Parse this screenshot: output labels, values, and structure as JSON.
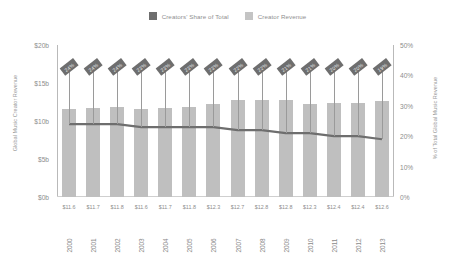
{
  "legend": {
    "items": [
      {
        "label": "Creators' Share of Total",
        "color": "#6e6e6e",
        "name": "legend-creators-share"
      },
      {
        "label": "Creator Revenue",
        "color": "#c4c4c4",
        "name": "legend-creator-revenue"
      }
    ]
  },
  "axes": {
    "left": {
      "title": "Global Music Creator Revenue",
      "ticks": [
        "$20b",
        "$15b",
        "$10b",
        "$5b",
        "$0b"
      ]
    },
    "right": {
      "title": "% of Total Global Music Revenue",
      "ticks": [
        "50%",
        "40%",
        "30%",
        "20%",
        "10%",
        "0%"
      ]
    }
  },
  "chart_data": {
    "type": "bar",
    "title": "",
    "xlabel": "",
    "ylabel": "Global Music Creator Revenue",
    "ylabel_secondary": "% of Total Global Music Revenue",
    "categories": [
      "2000",
      "2001",
      "2002",
      "2003",
      "2004",
      "2005",
      "2006",
      "2007",
      "2008",
      "2009",
      "2010",
      "2011",
      "2012",
      "2013"
    ],
    "ylim": [
      0,
      20
    ],
    "ylim_secondary": [
      0,
      50
    ],
    "grid": false,
    "legend_position": "top-center",
    "series": [
      {
        "name": "Creator Revenue",
        "type": "bar",
        "axis": "left",
        "unit": "$b",
        "color": "#bfbfbf",
        "values": [
          11.6,
          11.7,
          11.8,
          11.6,
          11.7,
          11.8,
          12.3,
          12.7,
          12.8,
          12.8,
          12.3,
          12.4,
          12.4,
          12.6
        ],
        "data_labels": [
          "$11.6",
          "$11.7",
          "$11.8",
          "$11.6",
          "$11.7",
          "$11.8",
          "$12.3",
          "$12.7",
          "$12.8",
          "$12.8",
          "$12.3",
          "$12.4",
          "$12.4",
          "$12.6"
        ]
      },
      {
        "name": "Creators' Share of Total",
        "type": "line",
        "axis": "right",
        "unit": "%",
        "color": "#6e6e6e",
        "values": [
          24,
          24,
          24,
          23,
          23,
          23,
          23,
          22,
          22,
          21,
          21,
          20,
          20,
          19
        ],
        "data_labels": [
          "24%",
          "24%",
          "24%",
          "23%",
          "23%",
          "23%",
          "23%",
          "22%",
          "22%",
          "21%",
          "21%",
          "20%",
          "20%",
          "19%"
        ]
      }
    ]
  }
}
